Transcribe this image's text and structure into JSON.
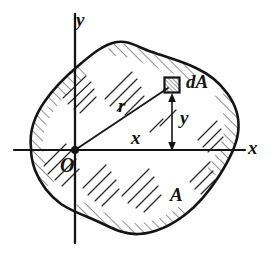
{
  "figure": {
    "type": "engineering-diagram",
    "background_color": "#ffffff",
    "ink_color": "#141414"
  },
  "axes": {
    "x_label": "x",
    "y_label": "y",
    "origin_label": "O",
    "x_axis": {
      "x1": 14,
      "y1": 150,
      "x2": 245,
      "y2": 150
    },
    "y_axis": {
      "x1": 75,
      "y1": 14,
      "x2": 75,
      "y2": 243
    },
    "origin_point": {
      "x": 75,
      "y": 150,
      "radius": 4
    }
  },
  "labels": {
    "radius": "r",
    "x_distance": "x",
    "y_distance": "y",
    "area_element": "dA",
    "area": "A"
  },
  "element": {
    "name": "dA",
    "center": {
      "x": 172,
      "y": 85
    },
    "size": 15
  },
  "measurements": {
    "r_line": {
      "x1": 75,
      "y1": 150,
      "x2": 168,
      "y2": 88
    },
    "y_dimension_line": {
      "x": 172,
      "y_top": 95,
      "y_bottom": 149
    }
  },
  "area_outline": {
    "label": "A",
    "label_position": {
      "x": 178,
      "y": 197
    },
    "path": "M 31,148 C 29,131 35,115 45,101 C 54,88 65,77 78,66 C 92,54 104,44 117,42 C 129,40 139,48 152,52 C 166,57 182,61 196,68 C 209,74 219,82 227,93 C 236,105 240,119 238,133 C 236,148 228,162 219,176 C 210,190 200,203 186,214 C 172,225 155,233 139,234 C 124,235 112,228 99,222 C 86,216 73,212 61,204 C 49,195 40,183 35,170 C 32,162 31,155 31,148 Z"
  },
  "hatching": {
    "style": "short diagonal strokes",
    "angle_degrees": 45,
    "interior_patches": 7,
    "boundary_hatch_segments": 5
  }
}
